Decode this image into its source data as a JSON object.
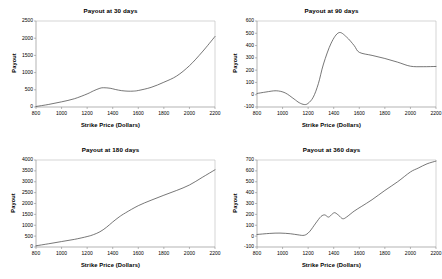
{
  "figure": {
    "title": "",
    "panel_count": 4,
    "background": "#ffffff",
    "line_color": "#4a4a4a",
    "axis_color": "#808080"
  },
  "chart_data": [
    {
      "type": "line",
      "title": "Payout at 30 days",
      "xlabel": "Strike Price (Dollars)",
      "ylabel": "Payout",
      "xlim": [
        800,
        2200
      ],
      "ylim": [
        0,
        2500
      ],
      "xticks": [
        800,
        1000,
        1200,
        1400,
        1600,
        1800,
        2000,
        2200
      ],
      "yticks": [
        0,
        500,
        1000,
        1500,
        2000,
        2500
      ],
      "grid": false,
      "legend": "none",
      "x": [
        800,
        900,
        1000,
        1100,
        1200,
        1250,
        1300,
        1330,
        1380,
        1420,
        1470,
        1520,
        1560,
        1600,
        1700,
        1800,
        1900,
        2000,
        2100,
        2200
      ],
      "y": [
        15,
        75,
        150,
        240,
        380,
        470,
        545,
        560,
        545,
        510,
        475,
        460,
        462,
        480,
        570,
        720,
        900,
        1200,
        1600,
        2050
      ]
    },
    {
      "type": "line",
      "title": "Payout at 90 days",
      "xlabel": "Strike Price (Dollars)",
      "ylabel": "Payout",
      "xlim": [
        800,
        2200
      ],
      "ylim": [
        -100,
        600
      ],
      "xticks": [
        800,
        1000,
        1200,
        1400,
        1600,
        1800,
        2000,
        2200
      ],
      "yticks": [
        -100,
        0,
        100,
        200,
        300,
        400,
        500,
        600
      ],
      "grid": false,
      "legend": "none",
      "x": [
        800,
        870,
        950,
        1020,
        1090,
        1130,
        1170,
        1200,
        1240,
        1280,
        1320,
        1380,
        1440,
        1500,
        1560,
        1600,
        1700,
        1800,
        1900,
        2000,
        2100,
        2200
      ],
      "y": [
        10,
        22,
        32,
        15,
        -35,
        -65,
        -80,
        -70,
        -20,
        90,
        250,
        420,
        505,
        470,
        400,
        345,
        320,
        295,
        265,
        232,
        228,
        230
      ]
    },
    {
      "type": "line",
      "title": "Payout at 180 days",
      "xlabel": "Strike Price (Dollars)",
      "ylabel": "Payout",
      "xlim": [
        800,
        2200
      ],
      "ylim": [
        0,
        4000
      ],
      "xticks": [
        800,
        1000,
        1200,
        1400,
        1600,
        1800,
        2000,
        2200
      ],
      "yticks": [
        0,
        500,
        1000,
        1500,
        2000,
        2500,
        3000,
        3500,
        4000
      ],
      "grid": false,
      "legend": "none",
      "x": [
        800,
        900,
        1000,
        1100,
        1200,
        1250,
        1300,
        1350,
        1400,
        1450,
        1500,
        1600,
        1700,
        1800,
        1900,
        2000,
        2100,
        2200
      ],
      "y": [
        55,
        150,
        250,
        350,
        480,
        570,
        700,
        900,
        1150,
        1380,
        1570,
        1900,
        2150,
        2380,
        2600,
        2850,
        3200,
        3550
      ]
    },
    {
      "type": "line",
      "title": "Payout at 360 days",
      "xlabel": "Strike Price (Dollars)",
      "ylabel": "Payout",
      "xlim": [
        800,
        2200
      ],
      "ylim": [
        -100,
        700
      ],
      "xticks": [
        800,
        1000,
        1200,
        1400,
        1600,
        1800,
        2000,
        2200
      ],
      "yticks": [
        -100,
        0,
        100,
        200,
        300,
        400,
        500,
        600,
        700
      ],
      "grid": false,
      "legend": "none",
      "x": [
        800,
        900,
        980,
        1060,
        1120,
        1170,
        1210,
        1260,
        1300,
        1330,
        1360,
        1390,
        1410,
        1440,
        1470,
        1500,
        1560,
        1620,
        1700,
        1800,
        1900,
        2000,
        2060,
        2130,
        2200
      ],
      "y": [
        15,
        25,
        28,
        22,
        12,
        8,
        40,
        120,
        180,
        195,
        175,
        205,
        215,
        190,
        160,
        175,
        230,
        275,
        335,
        420,
        500,
        590,
        625,
        665,
        690
      ]
    }
  ]
}
